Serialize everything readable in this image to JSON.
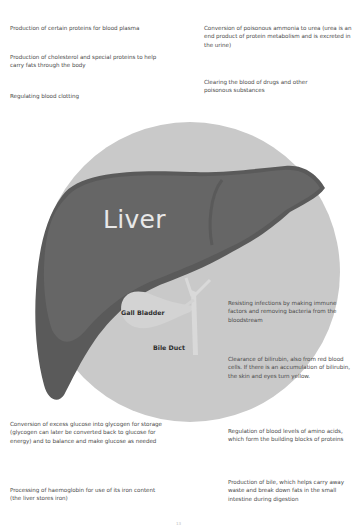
{
  "diagram": {
    "title": "Liver",
    "parts": {
      "gall_bladder": "Gall Bladder",
      "bile_duct": "Bile Duct"
    },
    "colors": {
      "background_circle": "#c9c9c9",
      "liver_main": "#636363",
      "liver_dark": "#535353",
      "gall_bladder": "#d4d4d4",
      "bile_duct": "#d9d9d9",
      "liver_label": "#e8e8e8"
    }
  },
  "functions": {
    "top_left": [
      "Production of certain proteins for blood plasma",
      "Production of cholesterol and special proteins to help carry fats through the body",
      "Regulating blood clotting"
    ],
    "top_right": [
      "Conversion of poisonous ammonia to urea (urea is an end product of protein metabolism and is excreted in the urine)",
      "Clearing the blood of drugs and other poisonous substances"
    ],
    "middle_right": [
      "Resisting infections by making immune factors and removing bacteria from the bloodstream",
      "Clearance of bilirubin, also from red blood cells. If there is an accumulation of bilirubin, the skin and eyes turn yellow."
    ],
    "bottom_left": [
      "Conversion of excess glucose into glycogen for storage (glycogen can later be converted back to glucose for energy) and to balance and make glucose as needed",
      "Processing of haemoglobin for use of its iron content (the liver stores iron)"
    ],
    "bottom_right": [
      "Regulation of blood levels of amino acids, which form the building blocks of proteins",
      "Production of bile, which helps carry away waste and break down fats in the small intestine during digestion"
    ]
  },
  "page_number": "13"
}
